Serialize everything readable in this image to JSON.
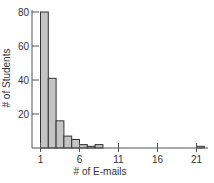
{
  "chart_data": {
    "type": "bar",
    "title": "",
    "xlabel": "# of E-mails",
    "ylabel": "# of Students",
    "bin_width": 1,
    "bins": [
      {
        "start": 1,
        "end": 2,
        "count": 80
      },
      {
        "start": 2,
        "end": 3,
        "count": 41
      },
      {
        "start": 3,
        "end": 4,
        "count": 16
      },
      {
        "start": 4,
        "end": 5,
        "count": 7
      },
      {
        "start": 5,
        "end": 6,
        "count": 5
      },
      {
        "start": 6,
        "end": 7,
        "count": 2
      },
      {
        "start": 7,
        "end": 8,
        "count": 1
      },
      {
        "start": 8,
        "end": 9,
        "count": 2
      },
      {
        "start": 21,
        "end": 22,
        "count": 1
      }
    ],
    "categories": [
      "1",
      "2",
      "3",
      "4",
      "5",
      "6",
      "7",
      "8",
      "21"
    ],
    "values": [
      80,
      41,
      16,
      7,
      5,
      2,
      1,
      2,
      1
    ],
    "x_ticks": [
      1,
      6,
      11,
      16,
      21
    ],
    "y_ticks": [
      20,
      40,
      60,
      80
    ],
    "xlim": [
      1,
      22
    ],
    "ylim": [
      0,
      80
    ],
    "grid": false,
    "legend": null,
    "bar_fill": "#c4c4c4",
    "bar_stroke": "#333333"
  }
}
